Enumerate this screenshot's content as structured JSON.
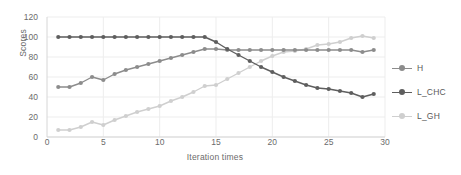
{
  "chart_data": {
    "type": "line",
    "title": "",
    "xlabel": "Iteration times",
    "ylabel": "Scores",
    "xlim": [
      0,
      30
    ],
    "ylim": [
      0,
      120
    ],
    "xticks": [
      0,
      5,
      10,
      15,
      20,
      25,
      30
    ],
    "yticks": [
      0,
      20,
      40,
      60,
      80,
      100,
      120
    ],
    "grid": true,
    "legend_position": "right",
    "x": [
      1,
      2,
      3,
      4,
      5,
      6,
      7,
      8,
      9,
      10,
      11,
      12,
      13,
      14,
      15,
      16,
      17,
      18,
      19,
      20,
      21,
      22,
      23,
      24,
      25,
      26,
      27,
      28,
      29
    ],
    "series": [
      {
        "name": "H",
        "color": "#8c8c8c",
        "values": [
          50,
          50,
          54,
          60,
          57,
          63,
          67,
          70,
          73,
          76,
          79,
          82,
          85,
          88,
          88,
          87,
          87,
          87,
          87,
          87,
          87,
          87,
          87,
          87,
          87,
          87,
          87,
          85,
          87
        ]
      },
      {
        "name": "L_CHC",
        "color": "#5e5e5e",
        "values": [
          100,
          100,
          100,
          100,
          100,
          100,
          100,
          100,
          100,
          100,
          100,
          100,
          100,
          100,
          95,
          88,
          82,
          76,
          70,
          65,
          60,
          56,
          52,
          49,
          48,
          46,
          44,
          40,
          43
        ]
      },
      {
        "name": "L_GH",
        "color": "#cfcfcf",
        "values": [
          7,
          7,
          10,
          15,
          12,
          17,
          21,
          25,
          28,
          31,
          36,
          40,
          45,
          51,
          52,
          58,
          64,
          70,
          76,
          81,
          85,
          86,
          88,
          92,
          93,
          95,
          99,
          101,
          99
        ]
      }
    ]
  },
  "legend": {
    "items": [
      {
        "label": "H"
      },
      {
        "label": "L_CHC"
      },
      {
        "label": "L_GH"
      }
    ]
  },
  "colors": {
    "h": "#8c8c8c",
    "l_chc": "#5e5e5e",
    "l_gh": "#cfcfcf",
    "grid": "#ededed",
    "axis": "#d6d6d6",
    "text": "#6b6b6b"
  }
}
